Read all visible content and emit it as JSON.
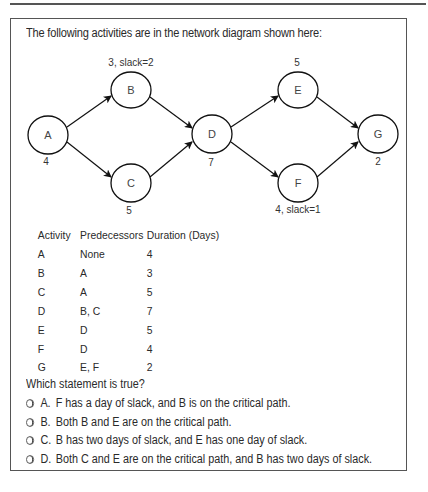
{
  "intro": "The following activities are in the network diagram shown here:",
  "diagram": {
    "nodes": [
      {
        "id": "A",
        "label": "A",
        "annotation": "4"
      },
      {
        "id": "B",
        "label": "B",
        "annotation": "3, slack=2"
      },
      {
        "id": "C",
        "label": "C",
        "annotation": "5"
      },
      {
        "id": "D",
        "label": "D",
        "annotation": "7"
      },
      {
        "id": "E",
        "label": "E",
        "annotation": "5"
      },
      {
        "id": "F",
        "label": "F",
        "annotation": "4, slack=1"
      },
      {
        "id": "G",
        "label": "G",
        "annotation": "2"
      }
    ],
    "edges": [
      [
        "A",
        "B"
      ],
      [
        "A",
        "C"
      ],
      [
        "B",
        "D"
      ],
      [
        "C",
        "D"
      ],
      [
        "D",
        "E"
      ],
      [
        "D",
        "F"
      ],
      [
        "E",
        "G"
      ],
      [
        "F",
        "G"
      ]
    ]
  },
  "table": {
    "headers": [
      "Activity",
      "Predecessors",
      "Duration (Days)"
    ],
    "rows": [
      [
        "A",
        "None",
        "4"
      ],
      [
        "B",
        "A",
        "3"
      ],
      [
        "C",
        "A",
        "5"
      ],
      [
        "D",
        "B, C",
        "7"
      ],
      [
        "E",
        "D",
        "5"
      ],
      [
        "F",
        "D",
        "4"
      ],
      [
        "G",
        "E, F",
        "2"
      ]
    ]
  },
  "question": {
    "prompt": "Which statement is true?",
    "options": [
      {
        "letter": "A.",
        "text": "F has a day of slack, and B is on the critical path."
      },
      {
        "letter": "B.",
        "text": "Both B and E are on the critical path."
      },
      {
        "letter": "C.",
        "text": "B has two days of slack, and E has one day of slack."
      },
      {
        "letter": "D.",
        "text": "Both C and E are on the critical path, and B has two days of slack."
      }
    ]
  }
}
